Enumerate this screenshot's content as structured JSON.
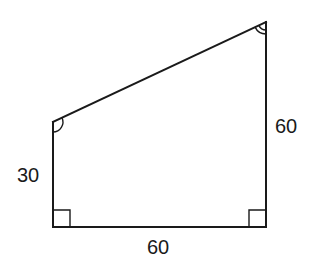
{
  "figure": {
    "type": "quadrilateral (right trapezoid)",
    "vertices": {
      "top_left": {
        "x": 53,
        "y": 122
      },
      "top_right": {
        "x": 266,
        "y": 22
      },
      "bottom_right": {
        "x": 266,
        "y": 227
      },
      "bottom_left": {
        "x": 53,
        "y": 227
      }
    },
    "side_labels": {
      "left": "30",
      "right": "60",
      "bottom": "60"
    },
    "angle_marks": {
      "bottom_left": "right-angle",
      "bottom_right": "right-angle",
      "top_left": "single-arc",
      "top_right": "double-arc"
    },
    "stroke_color": "#1a1a1a",
    "background_color": "#ffffff"
  }
}
